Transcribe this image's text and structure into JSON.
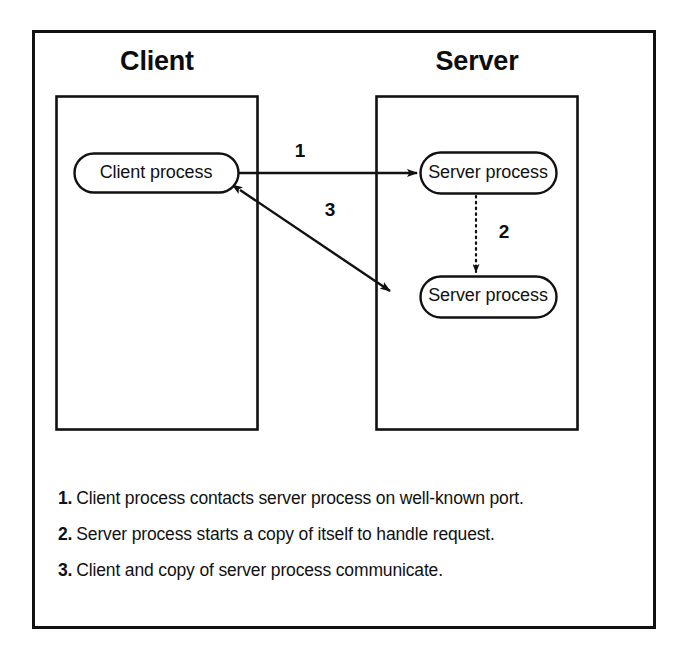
{
  "figure": {
    "background_color": "#ffffff",
    "ink_color": "#111111",
    "frame": {
      "name": "outer-frame"
    }
  },
  "zones": [
    {
      "id": "client",
      "title": "Client"
    },
    {
      "id": "server",
      "title": "Server"
    }
  ],
  "nodes": [
    {
      "id": "client-process",
      "label": "Client process",
      "zone": "client"
    },
    {
      "id": "server-process-1",
      "label": "Server process",
      "zone": "server"
    },
    {
      "id": "server-process-2",
      "label": "Server process",
      "zone": "server"
    }
  ],
  "arrows": [
    {
      "id": "arrow-1",
      "number": "1",
      "style": "solid",
      "heads": "single",
      "from": "client-process",
      "to": "server-process-1"
    },
    {
      "id": "arrow-2",
      "number": "2",
      "style": "dotted",
      "heads": "single",
      "from": "server-process-1",
      "to": "server-process-2"
    },
    {
      "id": "arrow-3",
      "number": "3",
      "style": "solid",
      "heads": "double",
      "from": "client-process",
      "to": "server-process-2"
    }
  ],
  "caption": {
    "items": [
      {
        "number": "1.",
        "text": "Client process contacts server process on well-known port."
      },
      {
        "number": "2.",
        "text": "Server process starts a copy of itself to handle request."
      },
      {
        "number": "3.",
        "text": "Client and copy of server process communicate."
      }
    ]
  }
}
